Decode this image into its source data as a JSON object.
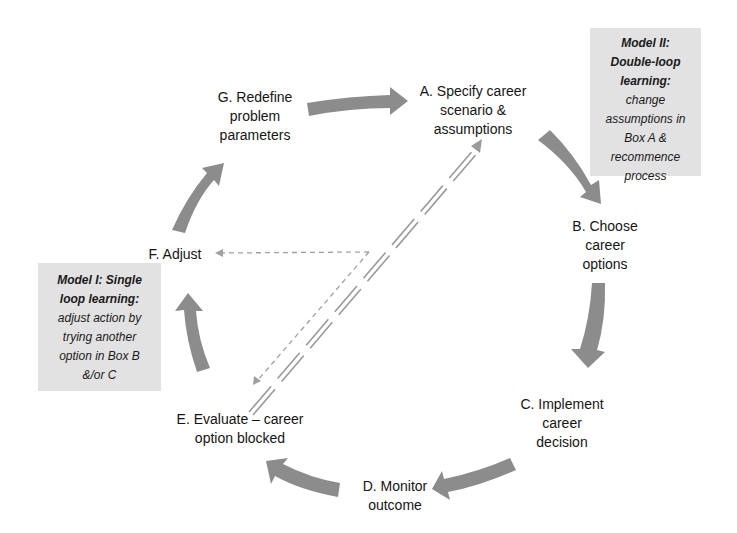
{
  "nodes": {
    "a": {
      "lines": [
        "A. Specify career",
        "scenario &",
        "assumptions"
      ]
    },
    "b": {
      "lines": [
        "B. Choose",
        "career",
        "options"
      ]
    },
    "c": {
      "lines": [
        "C. Implement",
        "career",
        "decision"
      ]
    },
    "d": {
      "lines": [
        "D. Monitor",
        "outcome"
      ]
    },
    "e": {
      "lines": [
        "E. Evaluate – career",
        "option blocked"
      ]
    },
    "f": {
      "lines": [
        "F. Adjust"
      ]
    },
    "g": {
      "lines": [
        "G. Redefine",
        "problem",
        "parameters"
      ]
    }
  },
  "notes": {
    "model2": {
      "title_lines": [
        "Model II:",
        "Double-loop",
        "learning:"
      ],
      "body_lines": [
        "change",
        "assumptions in",
        "Box A &",
        "recommence",
        "process"
      ]
    },
    "model1": {
      "title_lines": [
        "Model I: Single",
        "loop learning:"
      ],
      "body_lines": [
        "adjust action by",
        "trying another",
        "option in Box B",
        "&/or C"
      ]
    }
  },
  "colors": {
    "arrow": "#8c8c8c",
    "note_bg": "#e2e2e2",
    "dashed": "#9a9a9a"
  },
  "connectors": [
    {
      "from": "G",
      "to": "A",
      "style": "bold-arrow"
    },
    {
      "from": "A",
      "to": "B",
      "style": "bold-arrow"
    },
    {
      "from": "B",
      "to": "C",
      "style": "bold-arrow"
    },
    {
      "from": "C",
      "to": "D",
      "style": "bold-arrow"
    },
    {
      "from": "D",
      "to": "E",
      "style": "bold-arrow"
    },
    {
      "from": "E",
      "to": "F",
      "style": "bold-arrow"
    },
    {
      "from": "F",
      "to": "G",
      "style": "bold-arrow"
    },
    {
      "from": "E",
      "to": "A",
      "style": "double-dashed-arrow",
      "label": "double-loop"
    },
    {
      "from": "center",
      "to": "F",
      "style": "dashed-arrow",
      "label": "single-loop"
    },
    {
      "from": "center",
      "to": "E",
      "style": "dashed-arrow",
      "label": "single-loop"
    }
  ]
}
